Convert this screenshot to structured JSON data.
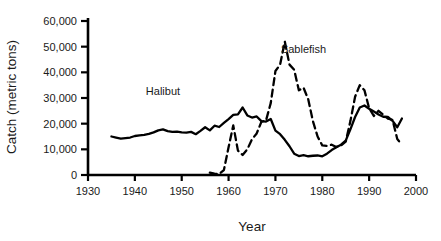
{
  "chart_data": {
    "type": "line",
    "title": "",
    "xlabel": "Year",
    "ylabel": "Catch (metric tons)",
    "xlim": [
      1930,
      2000
    ],
    "ylim": [
      0,
      60000
    ],
    "xticks": [
      1930,
      1940,
      1950,
      1960,
      1970,
      1980,
      1990,
      2000
    ],
    "xtick_labels": [
      "1930",
      "1940",
      "1950",
      "1960",
      "1970",
      "1980",
      "1990",
      "2000"
    ],
    "yticks": [
      0,
      10000,
      20000,
      30000,
      40000,
      50000,
      60000
    ],
    "ytick_labels": [
      "0",
      "10,000",
      "20,000",
      "30,000",
      "40,000",
      "50,000",
      "60,000"
    ],
    "grid": false,
    "legend_position": "inline-annotation",
    "series": [
      {
        "name": "Halibut",
        "style": "solid",
        "color": "#000000",
        "label_x": 1946,
        "label_y": 31000,
        "x": [
          1935,
          1936,
          1937,
          1938,
          1939,
          1940,
          1941,
          1942,
          1943,
          1944,
          1945,
          1946,
          1947,
          1948,
          1949,
          1950,
          1951,
          1952,
          1953,
          1954,
          1955,
          1956,
          1957,
          1958,
          1959,
          1960,
          1961,
          1962,
          1963,
          1964,
          1965,
          1966,
          1967,
          1968,
          1969,
          1970,
          1971,
          1972,
          1973,
          1974,
          1975,
          1976,
          1977,
          1978,
          1979,
          1980,
          1981,
          1982,
          1983,
          1984,
          1985,
          1986,
          1987,
          1988,
          1989,
          1990,
          1991,
          1992,
          1993,
          1994,
          1995,
          1996,
          1997
        ],
        "values": [
          15000,
          14600,
          14200,
          14400,
          14600,
          15200,
          15400,
          15600,
          16000,
          16600,
          17400,
          17800,
          17100,
          16800,
          16900,
          16600,
          16500,
          16800,
          15900,
          17200,
          18600,
          17400,
          19200,
          18700,
          20300,
          21800,
          23400,
          23600,
          26300,
          23200,
          22400,
          22800,
          21000,
          20800,
          21800,
          17300,
          15900,
          13700,
          11200,
          8300,
          7400,
          7700,
          7300,
          7500,
          7600,
          7300,
          8300,
          9700,
          10800,
          11800,
          13400,
          17800,
          22600,
          26300,
          27100,
          25800,
          24700,
          23600,
          22700,
          22600,
          21100,
          18600,
          22000
        ]
      },
      {
        "name": "Sablefish",
        "style": "dashed",
        "color": "#000000",
        "label_x": 1976,
        "label_y": 47500,
        "x": [
          1956,
          1957,
          1958,
          1959,
          1960,
          1961,
          1962,
          1963,
          1964,
          1965,
          1966,
          1967,
          1968,
          1969,
          1970,
          1971,
          1972,
          1973,
          1974,
          1975,
          1976,
          1977,
          1978,
          1979,
          1980,
          1981,
          1982,
          1983,
          1984,
          1985,
          1986,
          1987,
          1988,
          1989,
          1990,
          1991,
          1992,
          1993,
          1994,
          1995,
          1996,
          1997
        ],
        "values": [
          900,
          500,
          400,
          1900,
          10800,
          19300,
          9500,
          7800,
          10000,
          13900,
          16200,
          20700,
          21300,
          28000,
          40500,
          43000,
          52000,
          43000,
          41000,
          33000,
          34000,
          29500,
          21000,
          15000,
          11500,
          11300,
          11800,
          10900,
          11500,
          13000,
          21000,
          30500,
          35000,
          33000,
          26000,
          23000,
          25000,
          23500,
          22000,
          21500,
          14000,
          11800
        ]
      }
    ]
  }
}
